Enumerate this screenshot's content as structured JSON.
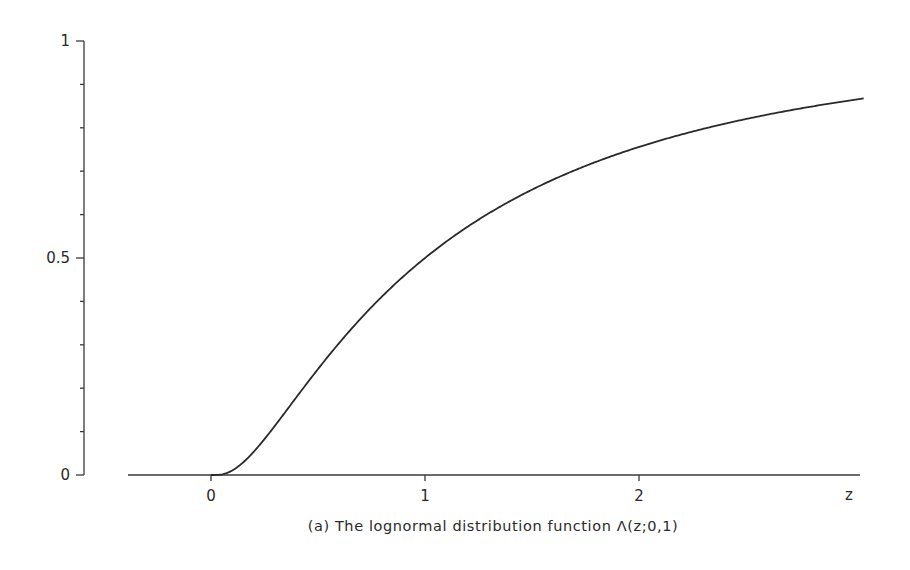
{
  "chart_data": {
    "type": "line",
    "title": "",
    "caption": "(a) The lognormal distribution function Λ(z;0,1)",
    "xlabel": "z",
    "ylabel": "",
    "xlim": [
      -0.4,
      3.05
    ],
    "ylim": [
      0,
      1
    ],
    "x_ticks": [
      0,
      1,
      2
    ],
    "x_tick_labels": [
      "0",
      "1",
      "2"
    ],
    "y_ticks": [
      0,
      0.5,
      1
    ],
    "y_tick_labels": [
      "0",
      "0.5",
      "1"
    ],
    "y_minor_ticks": [
      0.1,
      0.2,
      0.3,
      0.4,
      0.6,
      0.7,
      0.8,
      0.9
    ],
    "grid": false,
    "legend": null,
    "series": [
      {
        "name": "Λ(z;0,1)",
        "function": "lognormal CDF, mu=0, sigma=1",
        "x": [
          0,
          0.1,
          0.2,
          0.3,
          0.4,
          0.5,
          0.6,
          0.7,
          0.8,
          0.9,
          1.0,
          1.2,
          1.4,
          1.6,
          1.8,
          2.0,
          2.25,
          2.5,
          2.75,
          3.0,
          3.05
        ],
        "y": [
          0,
          0.011,
          0.054,
          0.114,
          0.18,
          0.244,
          0.305,
          0.362,
          0.412,
          0.458,
          0.5,
          0.571,
          0.631,
          0.681,
          0.721,
          0.756,
          0.791,
          0.82,
          0.844,
          0.864,
          0.868
        ]
      }
    ]
  }
}
